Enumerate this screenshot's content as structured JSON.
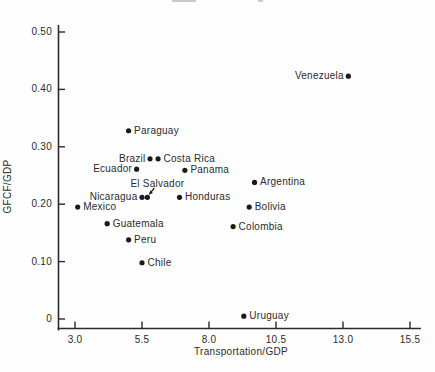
{
  "figure": {
    "background": "#fefefe",
    "ink_color": "#2b2b2b",
    "marker_color": "#1a1a1a"
  },
  "chart_data": {
    "type": "scatter",
    "title": "",
    "xlabel": "Transportation/GDP",
    "ylabel": "GFCF/GDP",
    "xlim": [
      3.0,
      15.5
    ],
    "ylim": [
      0,
      0.5
    ],
    "x_ticks": [
      {
        "label": "3.0",
        "value": 3.0
      },
      {
        "label": "5.5",
        "value": 5.5
      },
      {
        "label": "8.0",
        "value": 8.0
      },
      {
        "label": "10.5",
        "value": 10.5
      },
      {
        "label": "13.0",
        "value": 13.0
      },
      {
        "label": "15.5",
        "value": 15.5
      }
    ],
    "y_ticks": [
      {
        "label": "0.50",
        "value": 0.5
      },
      {
        "label": "0.40",
        "value": 0.4
      },
      {
        "label": "0.30",
        "value": 0.3
      },
      {
        "label": "0.20",
        "value": 0.2
      },
      {
        "label": "0.10",
        "value": 0.1
      },
      {
        "label": "0",
        "value": 0
      }
    ],
    "grid": false,
    "legend": "none",
    "marker": "filled-circle",
    "points": [
      {
        "label": "Venezuela",
        "x": 13.2,
        "y": 0.423,
        "label_side": "left"
      },
      {
        "label": "Paraguay",
        "x": 5.0,
        "y": 0.328,
        "label_side": "right"
      },
      {
        "label": "Brazil",
        "x": 5.8,
        "y": 0.279,
        "label_side": "left"
      },
      {
        "label": "Costa Rica",
        "x": 6.1,
        "y": 0.279,
        "label_side": "right"
      },
      {
        "label": "Ecuador",
        "x": 5.3,
        "y": 0.261,
        "label_side": "left"
      },
      {
        "label": "Panama",
        "x": 7.1,
        "y": 0.259,
        "label_side": "right"
      },
      {
        "label": "El Salvador",
        "x": 5.7,
        "y": 0.212,
        "label_side": "above-arrow"
      },
      {
        "label": "Nicaragua",
        "x": 5.5,
        "y": 0.212,
        "label_side": "left"
      },
      {
        "label": "Honduras",
        "x": 6.9,
        "y": 0.212,
        "label_side": "right"
      },
      {
        "label": "Argentina",
        "x": 9.7,
        "y": 0.238,
        "label_side": "right"
      },
      {
        "label": "Mexico",
        "x": 3.1,
        "y": 0.195,
        "label_side": "right"
      },
      {
        "label": "Bolivia",
        "x": 9.5,
        "y": 0.195,
        "label_side": "right"
      },
      {
        "label": "Guatemala",
        "x": 4.2,
        "y": 0.166,
        "label_side": "right"
      },
      {
        "label": "Colombia",
        "x": 8.9,
        "y": 0.161,
        "label_side": "right"
      },
      {
        "label": "Peru",
        "x": 5.0,
        "y": 0.138,
        "label_side": "right"
      },
      {
        "label": "Chile",
        "x": 5.5,
        "y": 0.098,
        "label_side": "right"
      },
      {
        "label": "Uruguay",
        "x": 9.3,
        "y": 0.005,
        "label_side": "right"
      }
    ]
  }
}
